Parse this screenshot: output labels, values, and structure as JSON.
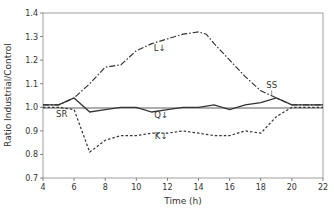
{
  "chart_data": {
    "type": "line",
    "title": "",
    "xlabel": "Time (h)",
    "ylabel": "Ratio Industrial/Control",
    "xlim": [
      4,
      22
    ],
    "ylim": [
      0.7,
      1.4
    ],
    "xticks": [
      4,
      6,
      8,
      10,
      12,
      14,
      16,
      18,
      20,
      22
    ],
    "yticks": [
      0.7,
      0.8,
      0.9,
      1.0,
      1.1,
      1.2,
      1.3,
      1.4
    ],
    "ytick_labels": [
      "0.7",
      "0.8",
      "0.9",
      "1.0",
      "1.1",
      "1.2",
      "1.3",
      "1.4"
    ],
    "grid": false,
    "reference_line": 1.0,
    "legend": "none (inline labels)",
    "series": [
      {
        "name": "L",
        "label": "L↓",
        "style": "dash-dot",
        "color": "#333333",
        "x": [
          4,
          5,
          6,
          7,
          8,
          9,
          10,
          11,
          12,
          13,
          14,
          14.5,
          15,
          16,
          17,
          18,
          19,
          20,
          22
        ],
        "values": [
          1.01,
          1.01,
          1.04,
          1.1,
          1.17,
          1.18,
          1.24,
          1.27,
          1.29,
          1.31,
          1.32,
          1.31,
          1.27,
          1.2,
          1.13,
          1.07,
          1.04,
          1.01,
          1.01
        ]
      },
      {
        "name": "Q",
        "label": "Q↓",
        "style": "solid",
        "color": "#333333",
        "x": [
          4,
          5,
          6,
          7,
          8,
          9,
          10,
          11,
          12,
          13,
          14,
          15,
          16,
          17,
          18,
          19,
          20,
          22
        ],
        "values": [
          1.01,
          1.01,
          1.04,
          0.98,
          0.99,
          1.0,
          1.0,
          0.98,
          0.99,
          1.0,
          1.0,
          1.01,
          0.99,
          1.01,
          1.02,
          1.04,
          1.01,
          1.01
        ]
      },
      {
        "name": "K",
        "label": "K↓",
        "style": "dotted",
        "color": "#333333",
        "x": [
          4,
          5,
          6,
          7,
          8,
          9,
          10,
          11,
          12,
          13,
          14,
          15,
          16,
          17,
          18,
          19,
          20,
          22
        ],
        "values": [
          1.0,
          1.0,
          0.99,
          0.81,
          0.86,
          0.88,
          0.88,
          0.89,
          0.89,
          0.9,
          0.89,
          0.88,
          0.88,
          0.9,
          0.89,
          0.96,
          1.0,
          1.0
        ]
      }
    ],
    "annotations": [
      {
        "text": "SR",
        "x": 5.2,
        "y": 0.96,
        "arrow_to": [
          5.3,
          1.0
        ]
      },
      {
        "text": "SS",
        "x": 18.7,
        "y": 1.08,
        "arrow_to": [
          18.7,
          1.04
        ]
      },
      {
        "text": "L↓",
        "x": 11.5,
        "y": 1.24
      },
      {
        "text": "Q↓",
        "x": 11.6,
        "y": 0.955
      },
      {
        "text": "K↓",
        "x": 11.6,
        "y": 0.865
      }
    ]
  }
}
